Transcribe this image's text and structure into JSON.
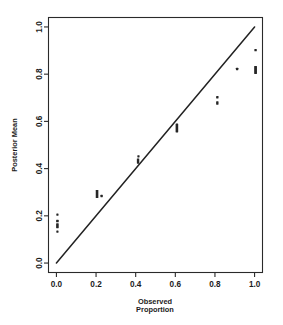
{
  "chart_data": {
    "type": "scatter",
    "title": "",
    "xlabel": "Observed Proportion",
    "xlabel_line1": "Observed",
    "xlabel_line2": "Proportion",
    "ylabel": "Posterior Mean",
    "xlim": [
      -0.04,
      1.04
    ],
    "ylim": [
      -0.04,
      1.04
    ],
    "grid": false,
    "legend": "none",
    "xticks": [
      "0.0",
      "0.2",
      "0.4",
      "0.6",
      "0.8",
      "1.0"
    ],
    "xtick_values": [
      0.0,
      0.2,
      0.4,
      0.6,
      0.8,
      1.0
    ],
    "yticks": [
      "0.0",
      "0.2",
      "0.4",
      "0.6",
      "0.8",
      "1.0"
    ],
    "ytick_values": [
      0.0,
      0.2,
      0.4,
      0.6,
      0.8,
      1.0
    ],
    "reference_line": {
      "name": "identity-line",
      "x": [
        0.0,
        1.0
      ],
      "y": [
        0.0,
        1.0
      ]
    },
    "points": [
      {
        "x": 0.005,
        "y": 0.205,
        "w": 2.2,
        "h": 2.2
      },
      {
        "x": 0.005,
        "y": 0.178,
        "w": 2.6,
        "h": 2.6
      },
      {
        "x": 0.005,
        "y": 0.158,
        "w": 2.6,
        "h": 5.0
      },
      {
        "x": 0.005,
        "y": 0.133,
        "w": 2.2,
        "h": 2.2
      },
      {
        "x": 0.205,
        "y": 0.292,
        "w": 2.6,
        "h": 8.0
      },
      {
        "x": 0.228,
        "y": 0.284,
        "w": 2.4,
        "h": 2.4
      },
      {
        "x": 0.412,
        "y": 0.432,
        "w": 2.4,
        "h": 5.2
      },
      {
        "x": 0.414,
        "y": 0.452,
        "w": 2.2,
        "h": 2.2
      },
      {
        "x": 0.608,
        "y": 0.572,
        "w": 2.6,
        "h": 9.0
      },
      {
        "x": 0.812,
        "y": 0.702,
        "w": 2.4,
        "h": 2.4
      },
      {
        "x": 0.812,
        "y": 0.678,
        "w": 2.4,
        "h": 3.4
      },
      {
        "x": 0.912,
        "y": 0.822,
        "w": 2.4,
        "h": 2.4
      },
      {
        "x": 1.005,
        "y": 0.902,
        "w": 2.4,
        "h": 2.4
      },
      {
        "x": 1.005,
        "y": 0.818,
        "w": 2.8,
        "h": 8.0
      }
    ]
  }
}
